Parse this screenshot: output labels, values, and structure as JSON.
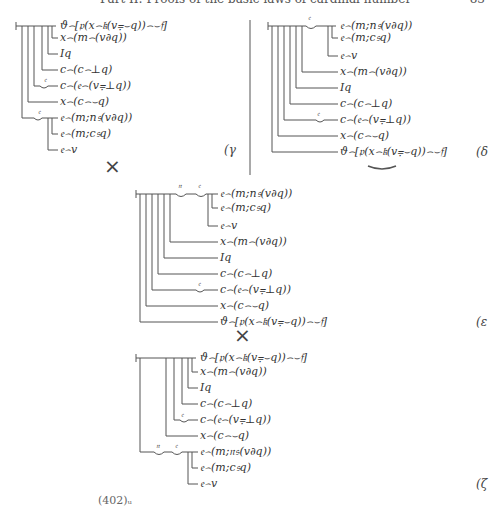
{
  "header": {
    "title": "Part II: Proofs of the basic laws of cardinal number",
    "page_number": "83"
  },
  "derivations": {
    "gamma": {
      "label": "(γ",
      "lines": [
        "ϑ⌢[𝔭(x⌢𝔨(v⩦⌣q))⌢⌣𝔣]",
        "x⌢(m⌢(v∂q))",
        "Iq",
        "c⌢(c⌢⊥q)",
        "c⌢(𝔢⌢(v⩦⊥q))",
        "x⌢(c⌢⌣q)",
        "𝔢⌢(m;n𝔰(v∂q))",
        "𝔢⌢(m;c𝔰q)",
        "𝔢⌢v"
      ],
      "concavity_letters": [
        "𝔢",
        "𝔢"
      ]
    },
    "delta": {
      "label": "(δ",
      "lines": [
        "𝔢⌢(m;n𝔰(v∂q))",
        "𝔢⌢(m;c𝔰q)",
        "𝔢⌢v",
        "x⌢(m⌢(v∂q))",
        "Iq",
        "c⌢(c⌢⊥q)",
        "c⌢(𝔢⌢(v⩦⊥q))",
        "x⌢(c⌢⌣q)",
        "ϑ⌢[𝔭(x⌢𝔨(v⩦⌣q))⌢⌣𝔣]"
      ],
      "concavity_letters": [
        "𝔢",
        "𝔢"
      ]
    },
    "epsilon": {
      "label": "(ε",
      "lines": [
        "𝔢⌢(m;n𝔰(v∂q))",
        "𝔢⌢(m;c𝔰q)",
        "𝔢⌢v",
        "x⌢(m⌢(v∂q))",
        "Iq",
        "c⌢(c⌢⊥q)",
        "c⌢(𝔢⌢(v⩦⊥q))",
        "x⌢(c⌢⌣q)",
        "ϑ⌢[𝔭(x⌢𝔨(v⩦⌣q))⌢⌣𝔣]"
      ],
      "concavity_letters": [
        "𝔫",
        "𝔢",
        "𝔢"
      ]
    },
    "zeta": {
      "label": "(ζ",
      "lines": [
        "ϑ⌢[𝔭(x⌢𝔨(v⩦⌣q))⌢⌣𝔣]",
        "x⌢(m⌢(v∂q))",
        "Iq",
        "c⌢(c⌢⊥q)",
        "c⌢(𝔢⌢(v⩦⊥q))",
        "x⌢(c⌢⌣q)",
        "𝔢⌢(m;𝔫𝔰(v∂q))",
        "𝔢⌢(m;c𝔰q)",
        "𝔢⌢v"
      ],
      "concavity_letters": [
        "𝔢",
        "𝔫",
        "𝔢"
      ]
    }
  },
  "cross_symbols": [
    "×",
    "×"
  ],
  "footnote": "(402)ᵤ"
}
